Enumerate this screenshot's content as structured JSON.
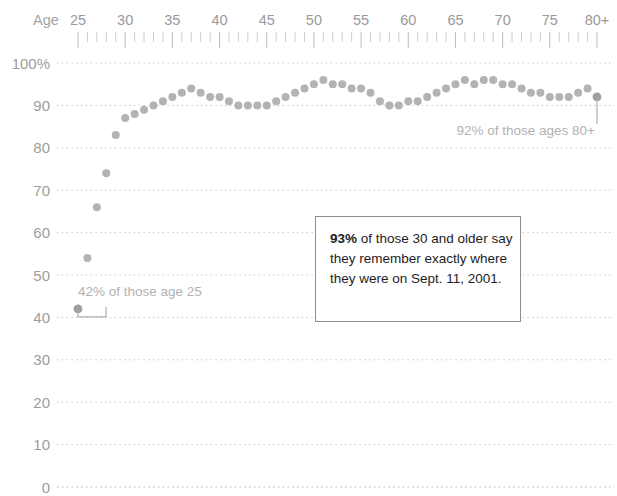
{
  "chart_data": {
    "type": "scatter",
    "title": "",
    "subtitle": "",
    "xlabel": "Age",
    "ylabel": "",
    "xlim": [
      25,
      80
    ],
    "ylim": [
      0,
      100
    ],
    "grid": true,
    "legend": "none",
    "x_axis_position": "top",
    "x_tick_labels": [
      "25",
      "30",
      "35",
      "40",
      "45",
      "50",
      "55",
      "60",
      "65",
      "70",
      "75",
      "80+"
    ],
    "x_tick_values": [
      25,
      30,
      35,
      40,
      45,
      50,
      55,
      60,
      65,
      70,
      75,
      80
    ],
    "x_minor_tick_interval": 1,
    "y_tick_labels": [
      "100%",
      "90",
      "80",
      "70",
      "60",
      "50",
      "40",
      "30",
      "20",
      "10",
      "0"
    ],
    "y_tick_values": [
      100,
      90,
      80,
      70,
      60,
      50,
      40,
      30,
      20,
      10,
      0
    ],
    "series": [
      {
        "name": "Remember exactly where they were on Sept. 11, 2001",
        "color": "#b3b3b3",
        "x": [
          25,
          26,
          27,
          28,
          29,
          30,
          31,
          32,
          33,
          34,
          35,
          36,
          37,
          38,
          39,
          40,
          41,
          42,
          43,
          44,
          45,
          46,
          47,
          48,
          49,
          50,
          51,
          52,
          53,
          54,
          55,
          56,
          57,
          58,
          59,
          60,
          61,
          62,
          63,
          64,
          65,
          66,
          67,
          68,
          69,
          70,
          71,
          72,
          73,
          74,
          75,
          76,
          77,
          78,
          79,
          80
        ],
        "values": [
          42,
          54,
          66,
          74,
          83,
          87,
          88,
          89,
          90,
          91,
          92,
          93,
          94,
          93,
          92,
          92,
          91,
          90,
          90,
          90,
          90,
          91,
          92,
          93,
          94,
          95,
          96,
          95,
          95,
          94,
          94,
          93,
          91,
          90,
          90,
          91,
          91,
          92,
          93,
          94,
          95,
          96,
          95,
          96,
          96,
          95,
          95,
          94,
          93,
          93,
          92,
          92,
          92,
          93,
          94,
          92
        ]
      }
    ],
    "annotations": [
      {
        "id": "left-callout",
        "text": "42% of those age 25",
        "value": 42,
        "age": 25
      },
      {
        "id": "right-callout",
        "text": "92% of those ages 80+",
        "value": 92,
        "age": 80
      },
      {
        "id": "main-callout",
        "highlight": "93%",
        "rest": " of those 30 and older say they remember exactly where they were on Sept. 11, 2001."
      }
    ]
  },
  "axis": {
    "age_word": "Age",
    "x_labels": [
      "25",
      "30",
      "35",
      "40",
      "45",
      "50",
      "55",
      "60",
      "65",
      "70",
      "75",
      "80+"
    ],
    "y_labels": [
      "100%",
      "90",
      "80",
      "70",
      "60",
      "50",
      "40",
      "30",
      "20",
      "10",
      "0"
    ]
  },
  "annotations": {
    "left": "42% of those age 25",
    "right": "92% of those ages 80+",
    "callout_highlight": "93%",
    "callout_rest": " of those 30 and older say they remember exactly where they were on Sept. 11, 2001."
  },
  "colors": {
    "dot": "#b3b3b3",
    "gridline": "#c9c9c9",
    "axis_text": "#9d9d9d",
    "annotation_text": "#b2b2b2",
    "callout_border": "#8c8c8c",
    "callout_text": "#1d1d1d"
  }
}
